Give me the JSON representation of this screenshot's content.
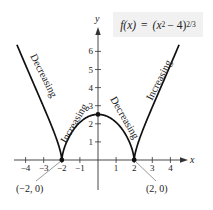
{
  "chart_data": {
    "type": "line",
    "function": "(x^2 - 4)^(2/3)",
    "xlabel": "x",
    "ylabel": "y",
    "xlim": [
      -4.5,
      4.5
    ],
    "ylim": [
      0,
      6.5
    ],
    "grid": false,
    "x_ticks": [
      -4,
      -3,
      -2,
      -1,
      1,
      2,
      3,
      4
    ],
    "y_ticks": [
      1,
      2,
      3,
      4,
      5,
      6
    ],
    "series": [
      {
        "name": "f(x)",
        "x": [
          -4.5,
          -4,
          -3.5,
          -3,
          -2.5,
          -2,
          -1.5,
          -1,
          -0.5,
          0,
          0.5,
          1,
          1.5,
          2,
          2.5,
          3,
          3.5,
          4,
          4.5
        ],
        "values": [
          6.52,
          5.24,
          4.08,
          2.92,
          1.66,
          0,
          1.45,
          2.08,
          2.41,
          2.52,
          2.41,
          2.08,
          1.45,
          0,
          1.66,
          2.92,
          4.08,
          5.24,
          6.52
        ]
      }
    ],
    "marked_points": [
      {
        "x": -2,
        "y": 0,
        "label": "(−2, 0)"
      },
      {
        "x": 2,
        "y": 0,
        "label": "(2, 0)"
      },
      {
        "x": 0,
        "y": 2.52,
        "label": ""
      }
    ],
    "annotations": [
      {
        "text": "Decreasing",
        "interval": "(-∞, -2)"
      },
      {
        "text": "Increasing",
        "interval": "(-2, 0)"
      },
      {
        "text": "Decreasing",
        "interval": "(0, 2)"
      },
      {
        "text": "Increasing",
        "interval": "(2, ∞)"
      }
    ]
  },
  "formula": {
    "prefix": "f(x)",
    "equals": "=",
    "body": "(x",
    "exp1": "2",
    "mid": " − 4)",
    "exp2": "2/3"
  },
  "axes": {
    "x_label": "x",
    "y_label": "y",
    "x_tick_labels": [
      "−4",
      "−3",
      "−2",
      "−1",
      "1",
      "2",
      "3",
      "4"
    ],
    "y_tick_labels": [
      "1",
      "2",
      "3",
      "4",
      "5",
      "6"
    ]
  },
  "labels": {
    "left_outer": "Decreasing",
    "left_inner": "Increasing",
    "right_inner": "Decreasing",
    "right_outer": "Increasing",
    "point_left": "(−2, 0)",
    "point_right": "(2, 0)"
  }
}
